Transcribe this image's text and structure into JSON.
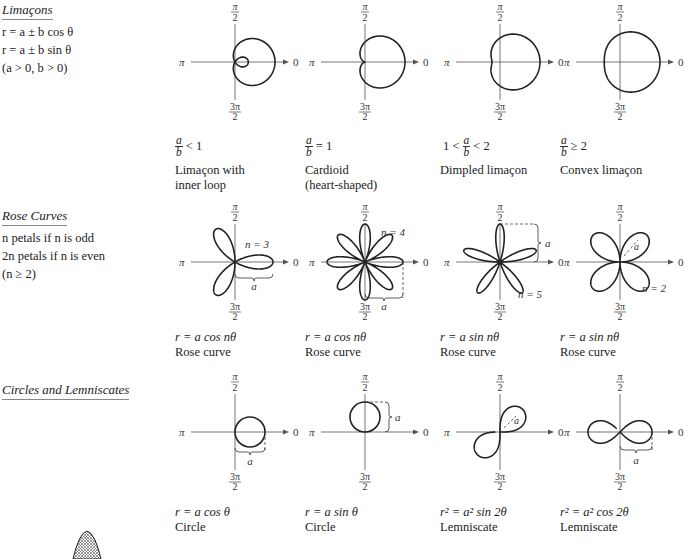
{
  "sections": [
    {
      "title": "Limaçons",
      "lines": [
        "r = a ± b cos θ",
        "r = a ± b sin θ",
        "(a > 0, b > 0)"
      ]
    },
    {
      "title": "Rose Curves",
      "lines": [
        "n petals if n is odd",
        "2n petals if n is even",
        "(n ≥ 2)"
      ]
    },
    {
      "title": "Circles and Lemniscates",
      "lines": []
    }
  ],
  "axis_labels": {
    "top_num": "π",
    "top_den": "2",
    "left": "π",
    "right": "0",
    "bottom_num": "3π",
    "bottom_den": "2"
  },
  "graphs": [
    {
      "id": "limacon-inner-loop",
      "condition_pre": "",
      "frac_num": "a",
      "frac_den": "b",
      "condition_post": "< 1",
      "caption": [
        "Limaçon with",
        "inner loop"
      ],
      "curve": "limacon",
      "a": 1,
      "b": 2
    },
    {
      "id": "cardioid",
      "condition_pre": "",
      "frac_num": "a",
      "frac_den": "b",
      "condition_post": "= 1",
      "caption": [
        "Cardioid",
        "(heart-shaped)"
      ],
      "curve": "limacon",
      "a": 1,
      "b": 1
    },
    {
      "id": "dimpled-limacon",
      "condition_pre": "1 <",
      "frac_num": "a",
      "frac_den": "b",
      "condition_post": "< 2",
      "caption": [
        "Dimpled limaçon"
      ],
      "curve": "limacon",
      "a": 1.5,
      "b": 1
    },
    {
      "id": "convex-limacon",
      "condition_pre": "",
      "frac_num": "a",
      "frac_den": "b",
      "condition_post": "≥ 2",
      "caption": [
        "Convex limaçon"
      ],
      "curve": "limacon",
      "a": 2.3,
      "b": 1
    },
    {
      "id": "rose-cos-3",
      "equation": "r = a cos nθ",
      "caption": [
        "Rose curve"
      ],
      "curve": "rose",
      "trig": "cos",
      "n": 3,
      "n_label": "n = 3",
      "a_label": "a"
    },
    {
      "id": "rose-cos-4",
      "equation": "r = a cos nθ",
      "caption": [
        "Rose curve"
      ],
      "curve": "rose",
      "trig": "cos",
      "n": 4,
      "n_label": "n = 4",
      "a_label": "a"
    },
    {
      "id": "rose-sin-5",
      "equation": "r = a sin nθ",
      "caption": [
        "Rose curve"
      ],
      "curve": "rose",
      "trig": "sin",
      "n": 5,
      "n_label": "n = 5",
      "a_label": "a"
    },
    {
      "id": "rose-sin-2",
      "equation": "r = a sin nθ",
      "caption": [
        "Rose curve"
      ],
      "curve": "rose",
      "trig": "sin",
      "n": 2,
      "n_label": "n = 2",
      "a_label": "a"
    },
    {
      "id": "circle-cos",
      "equation": "r = a cos θ",
      "caption": [
        "Circle"
      ],
      "curve": "circle",
      "trig": "cos",
      "a_label": "a"
    },
    {
      "id": "circle-sin",
      "equation": "r = a sin θ",
      "caption": [
        "Circle"
      ],
      "curve": "circle",
      "trig": "sin",
      "a_label": "a"
    },
    {
      "id": "lemniscate-sin",
      "equation": "r² = a² sin 2θ",
      "caption": [
        "Lemniscate"
      ],
      "curve": "lemniscate",
      "trig": "sin",
      "a_label": "a"
    },
    {
      "id": "lemniscate-cos",
      "equation": "r² = a² cos 2θ",
      "caption": [
        "Lemniscate"
      ],
      "curve": "lemniscate",
      "trig": "cos",
      "a_label": "a"
    }
  ]
}
